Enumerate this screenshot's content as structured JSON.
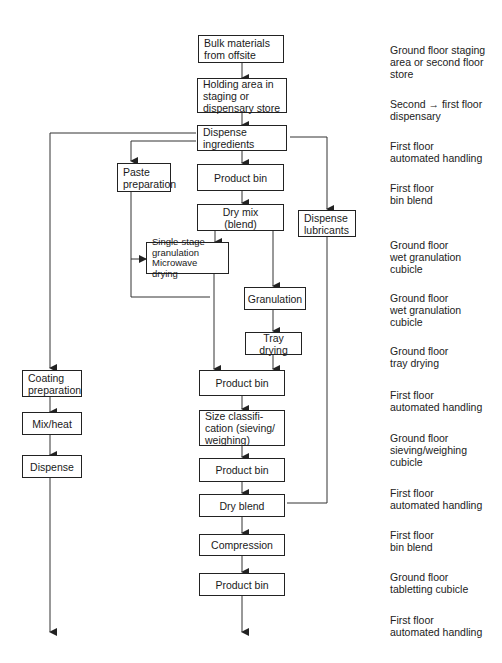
{
  "diagram": {
    "type": "process-flowchart",
    "nodes": [
      {
        "id": "bulk",
        "label": "Bulk materials\nfrom offsite"
      },
      {
        "id": "holding",
        "label": "Holding area in\nstaging or\ndispensary store"
      },
      {
        "id": "dispense_ing",
        "label": "Dispense\ningredients"
      },
      {
        "id": "paste",
        "label": "Paste\npreparation"
      },
      {
        "id": "pbin1",
        "label": "Product bin"
      },
      {
        "id": "drymix",
        "label": "Dry mix\n(blend)"
      },
      {
        "id": "lubricants",
        "label": "Dispense\nlubricants"
      },
      {
        "id": "single_stage",
        "label": "Single-stage\ngranulation\nMicrowave drying"
      },
      {
        "id": "granulation",
        "label": "Granulation"
      },
      {
        "id": "tray",
        "label": "Tray drying"
      },
      {
        "id": "coating",
        "label": "Coating\npreparation"
      },
      {
        "id": "pbin2",
        "label": "Product bin"
      },
      {
        "id": "mixheat",
        "label": "Mix/heat"
      },
      {
        "id": "sizeclass",
        "label": "Size classifi-\ncation (sieving/\nweighing)"
      },
      {
        "id": "dispense_coat",
        "label": "Dispense"
      },
      {
        "id": "pbin3",
        "label": "Product bin"
      },
      {
        "id": "dryblend",
        "label": "Dry blend"
      },
      {
        "id": "compression",
        "label": "Compression"
      },
      {
        "id": "pbin4",
        "label": "Product bin"
      }
    ],
    "edges": [
      [
        "bulk",
        "holding"
      ],
      [
        "holding",
        "dispense_ing"
      ],
      [
        "dispense_ing",
        "paste"
      ],
      [
        "dispense_ing",
        "pbin1"
      ],
      [
        "dispense_ing",
        "lubricants"
      ],
      [
        "dispense_ing",
        "coating"
      ],
      [
        "pbin1",
        "drymix"
      ],
      [
        "drymix",
        "single_stage"
      ],
      [
        "drymix",
        "granulation"
      ],
      [
        "paste",
        "single_stage"
      ],
      [
        "paste",
        "granulation"
      ],
      [
        "single_stage",
        "pbin2"
      ],
      [
        "granulation",
        "tray"
      ],
      [
        "tray",
        "pbin2"
      ],
      [
        "pbin2",
        "sizeclass"
      ],
      [
        "sizeclass",
        "pbin3"
      ],
      [
        "pbin3",
        "dryblend"
      ],
      [
        "lubricants",
        "dryblend"
      ],
      [
        "dryblend",
        "compression"
      ],
      [
        "compression",
        "pbin4"
      ],
      [
        "pbin4",
        "output_main"
      ],
      [
        "coating",
        "mixheat"
      ],
      [
        "mixheat",
        "dispense_coat"
      ],
      [
        "dispense_coat",
        "output_coating"
      ]
    ],
    "locations": [
      "Ground floor staging\narea or second floor\nstore",
      "Second → first floor\ndispensary",
      "First floor\nautomated handling",
      "First floor\nbin blend",
      "Ground floor\nwet granulation\ncubicle",
      "Ground floor\nwet granulation\ncubicle",
      "Ground floor\ntray drying",
      "First floor\nautomated handling",
      "Ground floor\nsieving/weighing\ncubicle",
      "First floor\nautomated handling",
      "First floor\nbin blend",
      "Ground floor\ntabletting cubicle",
      "First floor\nautomated handling"
    ]
  }
}
